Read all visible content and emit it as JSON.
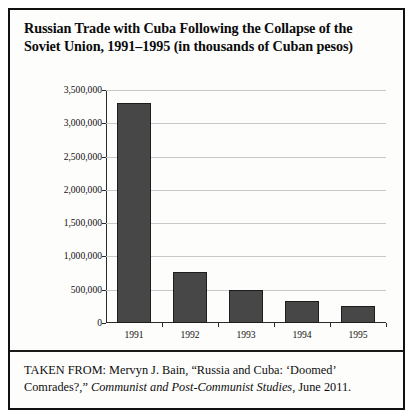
{
  "figure": {
    "title_lines": [
      "Russian Trade with Cuba Following the Collapse of the",
      "Soviet Union, 1991–1995 (in thousands of Cuban pesos)"
    ],
    "source_prefix": "TAKEN FROM: Mervyn J. Bain, “Russia and Cuba: ‘Doomed’ Comrades?,” ",
    "source_italic": "Communist and Post-Communist Studies",
    "source_suffix": ", June 2011."
  },
  "chart_data": {
    "type": "bar",
    "title": "Russian Trade with Cuba Following the Collapse of the Soviet Union, 1991–1995 (in thousands of Cuban pesos)",
    "xlabel": "",
    "ylabel": "",
    "categories": [
      "1991",
      "1992",
      "1993",
      "1994",
      "1995"
    ],
    "values": [
      3300000,
      770000,
      500000,
      330000,
      250000
    ],
    "ylim": [
      0,
      3500000
    ],
    "ytick_values": [
      0,
      500000,
      1000000,
      1500000,
      2000000,
      2500000,
      3000000,
      3500000
    ],
    "ytick_labels": [
      "0",
      "500,000",
      "1,000,000",
      "1,500,000",
      "2,000,000",
      "2,500,000",
      "3,000,000",
      "3,500,000"
    ],
    "grid": true,
    "legend": false,
    "bar_color": "#474747",
    "bar_edge_color": "#1d1d1d",
    "gridline_color": "#c9c9c9",
    "axis_color": "#2b2b2b"
  }
}
